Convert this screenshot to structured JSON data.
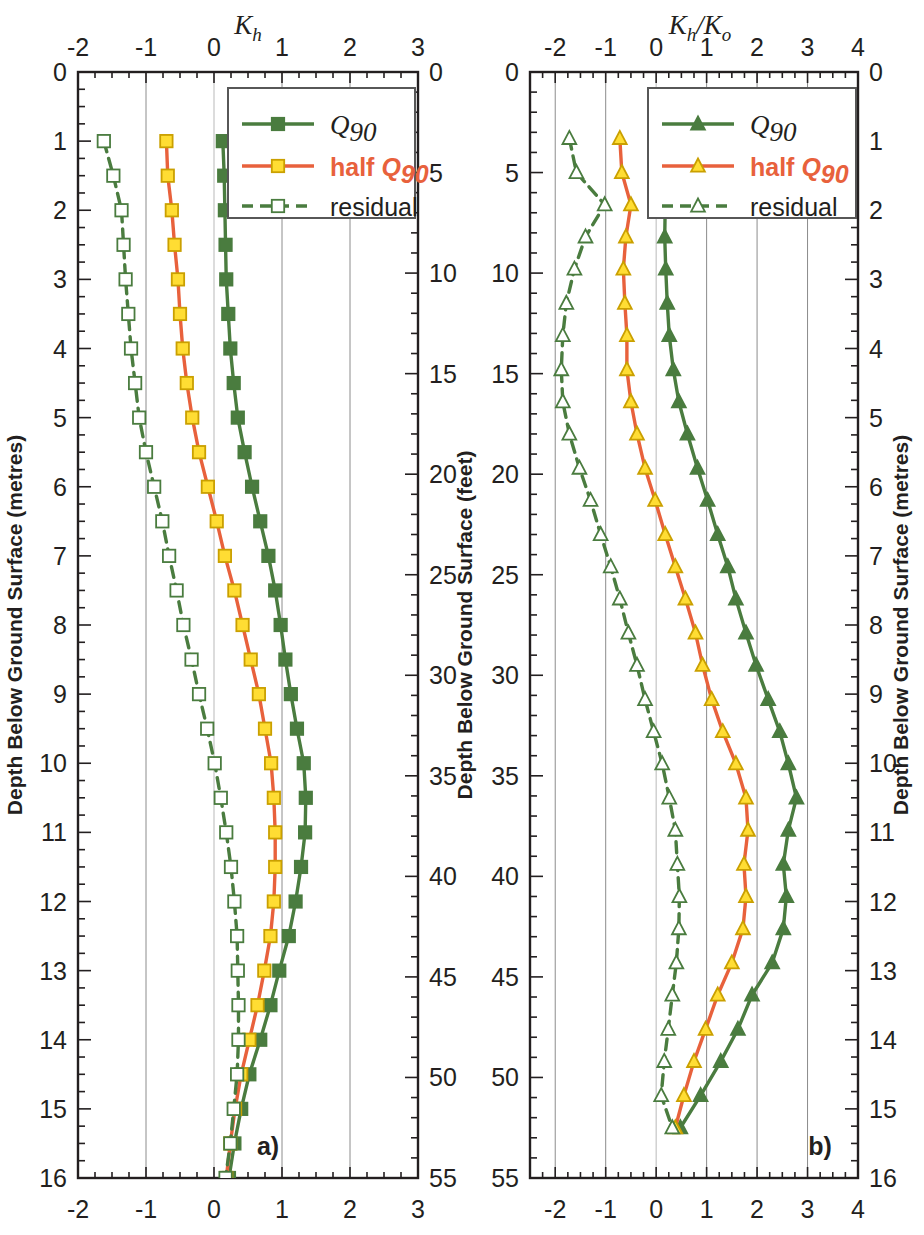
{
  "figure": {
    "background": "#ffffff",
    "panels": [
      {
        "id": "a",
        "panel_label": "a)",
        "top_title": "K_h",
        "top_title_main": "K",
        "top_title_sub": "h",
        "x_axis": {
          "min": -2,
          "max": 3,
          "ticks": [
            -2,
            -1,
            0,
            1,
            2,
            3
          ],
          "tick_labels": [
            "-2",
            "-1",
            "0",
            "1",
            "2",
            "3"
          ],
          "minor_step": 0.25
        },
        "y_left": {
          "label": "Depth Below Ground Surface (metres)",
          "min": 0,
          "max": 16,
          "ticks": [
            0,
            1,
            2,
            3,
            4,
            5,
            6,
            7,
            8,
            9,
            10,
            11,
            12,
            13,
            14,
            15,
            16
          ],
          "tick_labels": [
            "0",
            "1",
            "2",
            "3",
            "4",
            "5",
            "6",
            "7",
            "8",
            "9",
            "10",
            "11",
            "12",
            "13",
            "14",
            "15",
            "16"
          ],
          "minor_step": 0.25
        },
        "y_right": {
          "label": "Depth Below Ground Surface (feet)",
          "min": 0,
          "max": 55,
          "ticks": [
            0,
            5,
            10,
            15,
            20,
            25,
            30,
            35,
            40,
            45,
            50,
            55
          ],
          "tick_labels": [
            "0",
            "5",
            "10",
            "15",
            "20",
            "25",
            "30",
            "35",
            "40",
            "45",
            "50",
            "55"
          ],
          "minor_step": 1
        }
      },
      {
        "id": "b",
        "panel_label": "b)",
        "top_title": "K_h/K_o",
        "top_title_main": "K",
        "top_title_sub": "h",
        "top_title_main2": "K",
        "top_title_sub2": "o",
        "x_axis": {
          "min": -2.5,
          "max": 4,
          "ticks": [
            -2,
            -1,
            0,
            1,
            2,
            3,
            4
          ],
          "tick_labels": [
            "-2",
            "-1",
            "0",
            "1",
            "2",
            "3",
            "4"
          ],
          "minor_step": 0.25
        },
        "y_left": {
          "label": "Depth Below Ground Surface (feet)",
          "min": 0,
          "max": 55,
          "ticks": [
            0,
            5,
            10,
            15,
            20,
            25,
            30,
            35,
            40,
            45,
            50,
            55
          ],
          "tick_labels": [
            "0",
            "5",
            "10",
            "15",
            "20",
            "25",
            "30",
            "35",
            "40",
            "45",
            "50",
            "55"
          ],
          "minor_step": 1
        },
        "y_right": {
          "label": "Depth Below Ground Surface (metres)",
          "min": 0,
          "max": 16,
          "ticks": [
            0,
            1,
            2,
            3,
            4,
            5,
            6,
            7,
            8,
            9,
            10,
            11,
            12,
            13,
            14,
            15,
            16
          ],
          "tick_labels": [
            "0",
            "1",
            "2",
            "3",
            "4",
            "5",
            "6",
            "7",
            "8",
            "9",
            "10",
            "11",
            "12",
            "13",
            "14",
            "15",
            "16"
          ],
          "minor_step": 0.25
        }
      }
    ],
    "legend": {
      "entries": [
        {
          "label": "Q90",
          "label_main": "Q",
          "label_sub": "90",
          "color": "#4a7c3f",
          "marker": "filled-square",
          "line": "solid"
        },
        {
          "label": "half Q90",
          "label_prefix": "half ",
          "label_main": "Q",
          "label_sub": "90",
          "color": "#e8613c",
          "marker": "filled-yellow-square",
          "line": "solid"
        },
        {
          "label": "residual",
          "color": "#4a7c3f",
          "marker": "open-square",
          "line": "dashed"
        }
      ]
    },
    "colors": {
      "green": "#4a7c3f",
      "orange": "#e8613c",
      "yellow": "#ffdd33",
      "axis": "#231f20",
      "grid": "#8c8c8c"
    }
  },
  "chart_data": [
    {
      "type": "line",
      "id": "panel-a",
      "title": "Kh",
      "xlabel": "Kh",
      "ylabel": "Depth Below Ground Surface (metres)",
      "ylabel_secondary": "Depth Below Ground Surface (feet)",
      "xlim": [
        -2,
        3
      ],
      "ylim": [
        0,
        16
      ],
      "y_invert": true,
      "grid": true,
      "legend_position": "top-right",
      "marker": "square",
      "depths_m": [
        1,
        1.5,
        2,
        2.5,
        3,
        3.5,
        4,
        4.5,
        5,
        5.5,
        6,
        6.5,
        7,
        7.5,
        8,
        8.5,
        9,
        9.5,
        10,
        10.5,
        11,
        11.5,
        12,
        12.5,
        13,
        13.5,
        14,
        14.5,
        15,
        15.5,
        16
      ],
      "series": [
        {
          "name": "Q90",
          "color": "#4a7c3f",
          "line": "solid",
          "marker": "filled-square",
          "values": [
            0.13,
            0.15,
            0.16,
            0.17,
            0.18,
            0.21,
            0.24,
            0.29,
            0.35,
            0.45,
            0.56,
            0.68,
            0.8,
            0.9,
            0.98,
            1.05,
            1.13,
            1.22,
            1.32,
            1.35,
            1.34,
            1.28,
            1.2,
            1.1,
            0.96,
            0.83,
            0.68,
            0.52,
            0.4,
            0.3,
            0.22
          ]
        },
        {
          "name": "half Q90",
          "color": "#e8613c",
          "line": "solid",
          "marker": "filled-yellow-square",
          "values": [
            -0.7,
            -0.68,
            -0.62,
            -0.58,
            -0.53,
            -0.5,
            -0.46,
            -0.4,
            -0.32,
            -0.22,
            -0.09,
            0.04,
            0.16,
            0.3,
            0.42,
            0.54,
            0.66,
            0.75,
            0.84,
            0.88,
            0.9,
            0.9,
            0.88,
            0.83,
            0.74,
            0.64,
            0.52,
            0.4,
            0.31,
            0.24,
            0.18
          ]
        },
        {
          "name": "residual",
          "color": "#4a7c3f",
          "line": "dashed",
          "marker": "open-square",
          "values": [
            -1.62,
            -1.48,
            -1.36,
            -1.33,
            -1.3,
            -1.26,
            -1.22,
            -1.16,
            -1.1,
            -1.0,
            -0.88,
            -0.76,
            -0.66,
            -0.55,
            -0.45,
            -0.33,
            -0.22,
            -0.1,
            0.01,
            0.1,
            0.18,
            0.25,
            0.3,
            0.34,
            0.35,
            0.36,
            0.36,
            0.34,
            0.29,
            0.24,
            0.17
          ]
        }
      ]
    },
    {
      "type": "line",
      "id": "panel-b",
      "title": "Kh/Ko",
      "xlabel": "Kh/Ko",
      "ylabel": "Depth Below Ground Surface (feet)",
      "ylabel_secondary": "Depth Below Ground Surface (metres)",
      "xlim": [
        -2.5,
        4
      ],
      "ylim": [
        0,
        55
      ],
      "y_invert": true,
      "grid": true,
      "legend_position": "top-right",
      "marker": "triangle",
      "depths_ft": [
        3.3,
        5,
        6.6,
        8.2,
        9.8,
        11.5,
        13.1,
        14.8,
        16.4,
        18,
        19.7,
        21.3,
        23,
        24.6,
        26.2,
        27.9,
        29.5,
        31.2,
        32.8,
        34.4,
        36.1,
        37.7,
        39.4,
        41,
        42.6,
        44.3,
        45.9,
        47.6,
        49.2,
        50.9,
        52.5
      ],
      "series": [
        {
          "name": "Q90",
          "color": "#4a7c3f",
          "line": "solid",
          "marker": "filled-triangle",
          "values": [
            0.16,
            0.18,
            0.18,
            0.17,
            0.19,
            0.22,
            0.26,
            0.34,
            0.45,
            0.62,
            0.82,
            1.02,
            1.22,
            1.42,
            1.58,
            1.78,
            1.98,
            2.22,
            2.45,
            2.62,
            2.78,
            2.62,
            2.52,
            2.58,
            2.52,
            2.3,
            1.9,
            1.62,
            1.28,
            0.88,
            0.48
          ]
        },
        {
          "name": "half Q90",
          "color": "#e8613c",
          "line": "solid",
          "marker": "filled-triangle-yellow",
          "values": [
            -0.72,
            -0.68,
            -0.5,
            -0.6,
            -0.65,
            -0.62,
            -0.58,
            -0.58,
            -0.5,
            -0.38,
            -0.22,
            -0.02,
            0.18,
            0.38,
            0.58,
            0.78,
            0.92,
            1.1,
            1.32,
            1.58,
            1.78,
            1.82,
            1.74,
            1.78,
            1.72,
            1.5,
            1.22,
            0.98,
            0.75,
            0.55,
            0.38
          ]
        },
        {
          "name": "residual",
          "color": "#4a7c3f",
          "line": "dashed",
          "marker": "open-triangle",
          "values": [
            -1.72,
            -1.58,
            -1.02,
            -1.4,
            -1.62,
            -1.78,
            -1.85,
            -1.88,
            -1.85,
            -1.72,
            -1.52,
            -1.3,
            -1.1,
            -0.9,
            -0.72,
            -0.55,
            -0.38,
            -0.22,
            -0.05,
            0.12,
            0.26,
            0.38,
            0.42,
            0.46,
            0.45,
            0.4,
            0.32,
            0.24,
            0.16,
            0.1,
            0.32
          ]
        }
      ]
    }
  ]
}
